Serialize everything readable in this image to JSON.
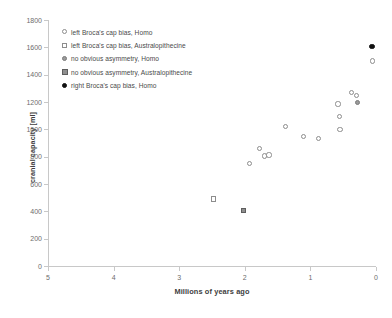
{
  "chart_data": {
    "type": "scatter",
    "title": "",
    "xlabel": "Millions of years ago",
    "ylabel": "cranial capacity [ml]",
    "xlim": [
      5,
      0
    ],
    "ylim": [
      0,
      1800
    ],
    "x_ticks": [
      5,
      4,
      3,
      2,
      1,
      0
    ],
    "y_ticks": [
      0,
      200,
      400,
      600,
      800,
      1000,
      1200,
      1400,
      1600,
      1800
    ],
    "x_reversed": true,
    "grid": false,
    "legend_position": "upper-left-inside",
    "series": [
      {
        "name": "left Broca's cap bias, Homo",
        "marker": "circle-open",
        "points": [
          {
            "x": 1.93,
            "y": 750
          },
          {
            "x": 1.78,
            "y": 860
          },
          {
            "x": 1.7,
            "y": 805
          },
          {
            "x": 1.63,
            "y": 812
          },
          {
            "x": 1.38,
            "y": 1020
          },
          {
            "x": 1.1,
            "y": 950
          },
          {
            "x": 0.88,
            "y": 935
          },
          {
            "x": 0.58,
            "y": 1185
          },
          {
            "x": 0.56,
            "y": 1095
          },
          {
            "x": 0.55,
            "y": 1000
          },
          {
            "x": 0.37,
            "y": 1270
          },
          {
            "x": 0.3,
            "y": 1245
          },
          {
            "x": 0.05,
            "y": 1500
          }
        ]
      },
      {
        "name": "left Broca's cap bias, Australopithecine",
        "marker": "square-open",
        "points": [
          {
            "x": 2.48,
            "y": 490
          }
        ]
      },
      {
        "name": "no obvious asymmetry, Homo",
        "marker": "circle-gray",
        "points": [
          {
            "x": 0.28,
            "y": 1195
          }
        ]
      },
      {
        "name": "no obvious asymmetry, Australopithecine",
        "marker": "square-gray",
        "points": [
          {
            "x": 2.02,
            "y": 405
          }
        ]
      },
      {
        "name": "right Broca's cap bias, Homo",
        "marker": "circle-black",
        "points": [
          {
            "x": 0.06,
            "y": 1605
          }
        ]
      }
    ]
  },
  "axes": {
    "y_title": "cranial capacity [ml]",
    "x_title": "Millions of years ago",
    "y_tick_labels": [
      "1800",
      "1600",
      "1400",
      "1200",
      "1000",
      "800",
      "600",
      "400",
      "200",
      "0"
    ],
    "x_tick_labels": [
      "5",
      "4",
      "3",
      "2",
      "1",
      "0"
    ]
  },
  "legend": {
    "items": [
      {
        "label": "left Broca's cap bias, Homo",
        "marker": "circle-open"
      },
      {
        "label": "left Broca's cap bias, Australopithecine",
        "marker": "square-open"
      },
      {
        "label": "no obvious asymmetry, Homo",
        "marker": "circle-gray"
      },
      {
        "label": "no obvious asymmetry, Australopithecine",
        "marker": "square-gray"
      },
      {
        "label": "right Broca's cap bias, Homo",
        "marker": "circle-black"
      }
    ]
  },
  "colors": {
    "axis": "#c8c8c8",
    "tick_text": "#6d6d6d",
    "title_text": "#404040",
    "marker_open_stroke": "#8d8d8d",
    "marker_gray_fill": "#9a9a9a",
    "marker_black_fill": "#111111"
  }
}
